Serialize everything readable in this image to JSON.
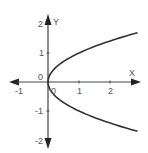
{
  "chart_data": {
    "type": "line",
    "title": "",
    "equation": "x = y^2",
    "xlabel": "X",
    "ylabel": "Y",
    "xlim": [
      -1.25,
      2.95
    ],
    "ylim": [
      -2.25,
      2.25
    ],
    "x_ticks": [
      -1,
      0,
      1,
      2
    ],
    "x_tick_labels": [
      "-1",
      "0",
      "1",
      "2"
    ],
    "y_ticks": [
      -2,
      -1,
      0,
      1,
      2
    ],
    "y_tick_labels": [
      "-2",
      "-1",
      "0",
      "1",
      "2"
    ],
    "grid": false,
    "legend": null,
    "series": [
      {
        "name": "upper branch y = sqrt(x)",
        "x": [
          0,
          0.05,
          0.25,
          0.5,
          1,
          1.5,
          2,
          2.5,
          2.9
        ],
        "y": [
          0,
          0.22,
          0.5,
          0.71,
          1,
          1.22,
          1.41,
          1.58,
          1.7
        ]
      },
      {
        "name": "lower branch y = -sqrt(x)",
        "x": [
          0,
          0.05,
          0.25,
          0.5,
          1,
          1.5,
          2,
          2.5,
          2.9
        ],
        "y": [
          0,
          -0.22,
          -0.5,
          -0.71,
          -1,
          -1.22,
          -1.41,
          -1.58,
          -1.7
        ]
      }
    ],
    "colors": {
      "curve": "#333333",
      "axis": "#444444",
      "labels": "#555555"
    }
  }
}
